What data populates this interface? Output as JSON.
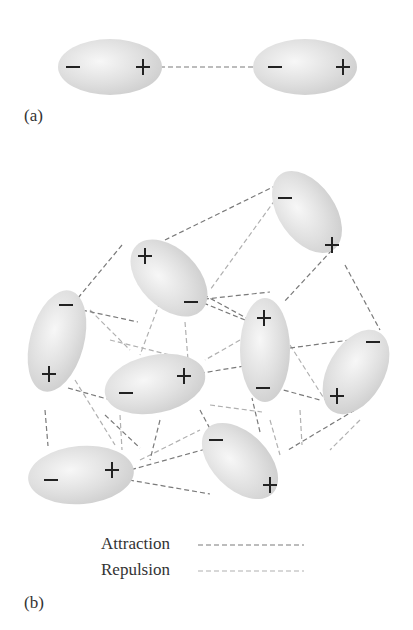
{
  "panel_a": {
    "label": "(a)",
    "molecules": [
      {
        "cx": 110,
        "cy": 67,
        "rx": 52,
        "ry": 28,
        "rot": 0,
        "neg": {
          "x": 73,
          "y": 67
        },
        "pos": {
          "x": 143,
          "y": 67
        }
      },
      {
        "cx": 305,
        "cy": 67,
        "rx": 52,
        "ry": 28,
        "rot": 0,
        "neg": {
          "x": 275,
          "y": 67
        },
        "pos": {
          "x": 343,
          "y": 67
        }
      }
    ],
    "attraction_lines": [
      [
        160,
        67,
        257,
        67
      ]
    ]
  },
  "panel_b": {
    "label": "(b)",
    "molecules": [
      {
        "cx": 307,
        "cy": 212,
        "rx": 28,
        "ry": 46,
        "rot": -35,
        "neg": {
          "x": 285,
          "y": 198
        },
        "pos": {
          "x": 332,
          "y": 245
        }
      },
      {
        "cx": 169,
        "cy": 278,
        "rx": 29,
        "ry": 46,
        "rot": -45,
        "neg": {
          "x": 191,
          "y": 302
        },
        "pos": {
          "x": 145,
          "y": 256
        }
      },
      {
        "cx": 57,
        "cy": 341,
        "rx": 27,
        "ry": 52,
        "rot": 15,
        "neg": {
          "x": 66,
          "y": 305
        },
        "pos": {
          "x": 49,
          "y": 374
        }
      },
      {
        "cx": 155,
        "cy": 384,
        "rx": 51,
        "ry": 29,
        "rot": -12,
        "neg": {
          "x": 126,
          "y": 393
        },
        "pos": {
          "x": 184,
          "y": 376
        }
      },
      {
        "cx": 265,
        "cy": 350,
        "rx": 25,
        "ry": 52,
        "rot": 0,
        "neg": {
          "x": 263,
          "y": 388
        },
        "pos": {
          "x": 264,
          "y": 318
        }
      },
      {
        "cx": 356,
        "cy": 372,
        "rx": 28,
        "ry": 46,
        "rot": 30,
        "neg": {
          "x": 373,
          "y": 342
        },
        "pos": {
          "x": 337,
          "y": 396
        }
      },
      {
        "cx": 240,
        "cy": 461,
        "rx": 28,
        "ry": 46,
        "rot": -45,
        "neg": {
          "x": 216,
          "y": 440
        },
        "pos": {
          "x": 270,
          "y": 485
        }
      },
      {
        "cx": 81,
        "cy": 475,
        "rx": 53,
        "ry": 29,
        "rot": -5,
        "neg": {
          "x": 51,
          "y": 480
        },
        "pos": {
          "x": 112,
          "y": 470
        }
      }
    ],
    "attraction_lines": [
      [
        277,
        185,
        165,
        240
      ],
      [
        332,
        250,
        284,
        302
      ],
      [
        345,
        265,
        380,
        330
      ],
      [
        122,
        245,
        78,
        298
      ],
      [
        196,
        300,
        270,
        292
      ],
      [
        196,
        300,
        250,
        322
      ],
      [
        82,
        310,
        138,
        322
      ],
      [
        68,
        388,
        118,
        402
      ],
      [
        184,
        376,
        250,
        365
      ],
      [
        276,
        388,
        320,
        400
      ],
      [
        213,
        447,
        130,
        470
      ],
      [
        260,
        432,
        252,
        398
      ],
      [
        200,
        410,
        216,
        440
      ],
      [
        129,
        480,
        210,
        494
      ],
      [
        45,
        410,
        48,
        446
      ],
      [
        160,
        420,
        150,
        460
      ],
      [
        355,
        410,
        288,
        450
      ],
      [
        290,
        348,
        350,
        340
      ],
      [
        250,
        320,
        204,
        295
      ],
      [
        105,
        415,
        140,
        448
      ]
    ],
    "repulsion_lines": [
      [
        275,
        200,
        210,
        290
      ],
      [
        160,
        302,
        140,
        355
      ],
      [
        90,
        310,
        130,
        350
      ],
      [
        75,
        380,
        115,
        445
      ],
      [
        240,
        340,
        205,
        360
      ],
      [
        290,
        345,
        325,
        400
      ],
      [
        210,
        405,
        262,
        412
      ],
      [
        120,
        415,
        122,
        450
      ],
      [
        300,
        410,
        302,
        445
      ],
      [
        270,
        420,
        280,
        455
      ],
      [
        110,
        340,
        170,
        355
      ],
      [
        185,
        322,
        188,
        360
      ],
      [
        140,
        460,
        200,
        430
      ],
      [
        360,
        420,
        330,
        450
      ]
    ]
  },
  "legend": {
    "items": [
      {
        "label": "Attraction",
        "color": "#7a7a7a"
      },
      {
        "label": "Repulsion",
        "color": "#b0b0b0"
      }
    ]
  },
  "symbols": {
    "positive": "+",
    "negative": "−"
  },
  "colors": {
    "molecule_fill": "#d8d8d8",
    "molecule_highlight": "#f4f4f4",
    "symbol": "#222222",
    "attraction": "#7a7a7a",
    "repulsion": "#b0b0b0"
  }
}
